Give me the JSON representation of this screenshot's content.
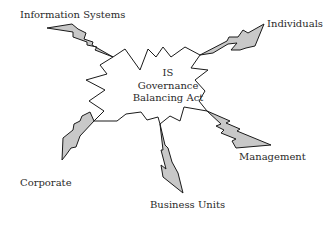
{
  "diagram": {
    "center": {
      "lines": [
        "IS",
        "Governance",
        "Balancing Act"
      ]
    },
    "stakeholders": [
      {
        "id": "information-systems",
        "label": "Information Systems"
      },
      {
        "id": "individuals",
        "label": "Individuals"
      },
      {
        "id": "management",
        "label": "Management"
      },
      {
        "id": "business-units",
        "label": "Business Units"
      },
      {
        "id": "corporate",
        "label": "Corporate"
      }
    ],
    "colors": {
      "bolt_fill": "#c8c8c8",
      "stroke": "#1a1a1a",
      "star_fill": "#ffffff",
      "text": "#2a2a2a",
      "background": "#ffffff"
    }
  }
}
